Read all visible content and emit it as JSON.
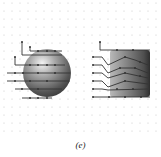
{
  "figure": {
    "caption": "(e)",
    "grid": {
      "spacing": 8,
      "offset_x": 4,
      "offset_y": 3,
      "rows_until": 135,
      "dot_color": "#c8c8c8"
    },
    "objects": [
      {
        "name": "sphere",
        "cx": 47,
        "cy": 73,
        "r": 24
      },
      {
        "name": "cylinder",
        "x": 110,
        "y": 50,
        "w": 40,
        "h": 47
      }
    ],
    "path_color": "#333333"
  }
}
